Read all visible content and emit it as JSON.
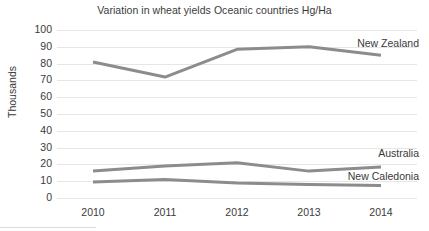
{
  "chart_data": {
    "type": "line",
    "title": "Variation in wheat yields Oceanic countries Hg/Ha",
    "xlabel": "",
    "ylabel": "Thousands",
    "categories": [
      "2010",
      "2011",
      "2012",
      "2013",
      "2014"
    ],
    "ylim": [
      0,
      100
    ],
    "yticks": [
      "100",
      "90",
      "80",
      "70",
      "60",
      "50",
      "40",
      "30",
      "20",
      "10",
      "0"
    ],
    "ytick_values": [
      100,
      90,
      80,
      70,
      60,
      50,
      40,
      30,
      20,
      10,
      0
    ],
    "grid": "horizontal",
    "legend_position": "inline-right-end-labels",
    "series": [
      {
        "name": "New Zealand",
        "values": [
          81,
          72,
          88.5,
          90,
          85
        ],
        "color": "#8c8c8c",
        "label_value": 92
      },
      {
        "name": "Australia",
        "values": [
          16,
          19,
          21,
          16,
          18.5
        ],
        "color": "#8c8c8c",
        "label_value": 27
      },
      {
        "name": "New Caledonia",
        "values": [
          9.5,
          11,
          9,
          8,
          7.5
        ],
        "color": "#8c8c8c",
        "label_value": 13
      }
    ]
  },
  "style": {
    "gridline_color": "#e6e6e6",
    "text_color": "#3a3a3a",
    "background": "#ffffff"
  }
}
